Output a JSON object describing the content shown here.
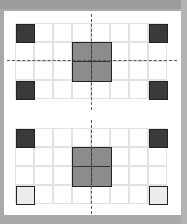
{
  "diagram": {
    "colors": {
      "background": "#a9a9a9",
      "card": "#ffffff",
      "grid_line": "#e2e2e2",
      "dark_square": "#3a3a3a",
      "mid_square": "#8c8c8c",
      "light_square": "#ececec",
      "symmetry_line": "#555555"
    },
    "grids": [
      {
        "name": "top-grid",
        "cols": 8,
        "rows": 4,
        "symmetry_lines": [
          "vertical",
          "horizontal"
        ],
        "shaded": [
          {
            "col": 0,
            "row": 0,
            "shade": "dark"
          },
          {
            "col": 7,
            "row": 0,
            "shade": "dark"
          },
          {
            "col": 0,
            "row": 3,
            "shade": "dark"
          },
          {
            "col": 7,
            "row": 3,
            "shade": "dark"
          },
          {
            "col": 3,
            "row": 1,
            "shade": "mid",
            "span": 2
          }
        ]
      },
      {
        "name": "bottom-grid",
        "cols": 8,
        "rows": 4,
        "symmetry_lines": [
          "vertical"
        ],
        "shaded": [
          {
            "col": 0,
            "row": 0,
            "shade": "dark"
          },
          {
            "col": 7,
            "row": 0,
            "shade": "dark"
          },
          {
            "col": 0,
            "row": 3,
            "shade": "light"
          },
          {
            "col": 7,
            "row": 3,
            "shade": "light"
          },
          {
            "col": 3,
            "row": 1,
            "shade": "mid",
            "span": 2
          }
        ]
      }
    ]
  }
}
